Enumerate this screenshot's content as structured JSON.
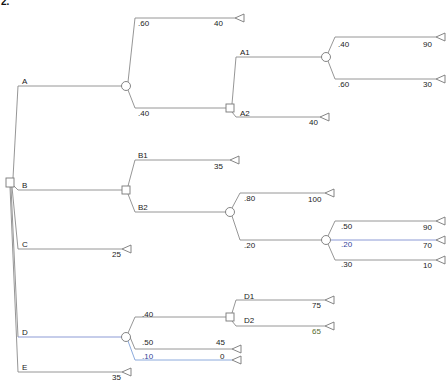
{
  "header": {
    "problem_number": "2."
  },
  "colors": {
    "line": "#8a8a8a",
    "node_stroke": "#777777",
    "text": "#222222",
    "accent_blue": "#6a7fd0"
  },
  "tree": {
    "root": {
      "type": "decision"
    },
    "branches": {
      "A": {
        "label": "A",
        "node": "chance",
        "outcomes": [
          {
            "prob": ".60",
            "payoff": "40"
          },
          {
            "prob": ".40",
            "node": "decision",
            "branches": {
              "A1": {
                "label": "A1",
                "node": "chance",
                "outcomes": [
                  {
                    "prob": ".40",
                    "payoff": "90"
                  },
                  {
                    "prob": ".60",
                    "payoff": "30"
                  }
                ]
              },
              "A2": {
                "label": "A2",
                "payoff": "40"
              }
            }
          }
        ]
      },
      "B": {
        "label": "B",
        "node": "decision",
        "branches": {
          "B1": {
            "label": "B1",
            "payoff": "35"
          },
          "B2": {
            "label": "B2",
            "node": "chance",
            "outcomes": [
              {
                "prob": ".80",
                "payoff": "100"
              },
              {
                "prob": ".20",
                "node": "chance",
                "outcomes": [
                  {
                    "prob": ".50",
                    "payoff": "90"
                  },
                  {
                    "prob": ".20",
                    "payoff": "70"
                  },
                  {
                    "prob": ".30",
                    "payoff": "10"
                  }
                ]
              }
            ]
          }
        }
      },
      "C": {
        "label": "C",
        "payoff": "25"
      },
      "D": {
        "label": "D",
        "node": "chance",
        "outcomes": [
          {
            "prob": ".40",
            "node": "decision",
            "branches": {
              "D1": {
                "label": "D1",
                "payoff": "75"
              },
              "D2": {
                "label": "D2",
                "payoff": "65"
              }
            }
          },
          {
            "prob": ".50",
            "payoff": "45"
          },
          {
            "prob": ".10",
            "payoff": "0"
          }
        ]
      },
      "E": {
        "label": "E",
        "payoff": "35"
      }
    }
  }
}
